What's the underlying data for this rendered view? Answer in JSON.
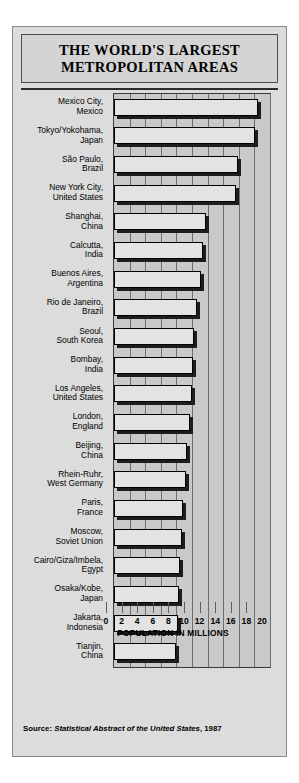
{
  "title": {
    "line1": "THE WORLD'S LARGEST",
    "line2": "METROPOLITAN AREAS"
  },
  "source": {
    "prefix": "Source: ",
    "italic": "Statistical Abstract of the United States",
    "suffix": ", 1987"
  },
  "chart_data": {
    "type": "bar",
    "orientation": "horizontal",
    "title": "THE WORLD'S LARGEST METROPOLITAN AREAS",
    "xlabel": "POPULATION IN MILLIONS",
    "ylabel": "",
    "xlim": [
      0,
      20
    ],
    "xticks": [
      0,
      2,
      4,
      6,
      8,
      10,
      12,
      14,
      16,
      18,
      20
    ],
    "grid": true,
    "legend": false,
    "categories": [
      "Mexico City, Mexico",
      "Tokyo/Yokohama, Japan",
      "São Paulo, Brazil",
      "New York City, United States",
      "Shanghai, China",
      "Calcutta, India",
      "Buenos Aires, Argentina",
      "Rio de Janeiro, Brazil",
      "Seoul, South Korea",
      "Bombay, India",
      "Los Angeles, United States",
      "London, England",
      "Beijing, China",
      "Rhein-Ruhr, West Germany",
      "Paris, France",
      "Moscow, Soviet Union",
      "Cairo/Giza/Imbela, Egypt",
      "Osaka/Kobe, Japan",
      "Jakarta, Indonesia",
      "Tianjin, China"
    ],
    "values": [
      18.4,
      18.1,
      15.9,
      15.6,
      11.8,
      11.4,
      11.1,
      10.7,
      10.3,
      10.1,
      10.0,
      9.8,
      9.4,
      9.2,
      8.9,
      8.7,
      8.5,
      8.3,
      8.2,
      8.0
    ],
    "units": "millions"
  },
  "rows": [
    {
      "label_line1": "Mexico City,",
      "label_line2": "Mexico",
      "value": 18.4
    },
    {
      "label_line1": "Tokyo/Yokohama,",
      "label_line2": "Japan",
      "value": 18.1
    },
    {
      "label_line1": "São Paulo,",
      "label_line2": "Brazil",
      "value": 15.9
    },
    {
      "label_line1": "New York City,",
      "label_line2": "United States",
      "value": 15.6
    },
    {
      "label_line1": "Shanghai,",
      "label_line2": "China",
      "value": 11.8
    },
    {
      "label_line1": "Calcutta,",
      "label_line2": "India",
      "value": 11.4
    },
    {
      "label_line1": "Buenos Aires,",
      "label_line2": "Argentina",
      "value": 11.1
    },
    {
      "label_line1": "Rio de Janeiro,",
      "label_line2": "Brazil",
      "value": 10.7
    },
    {
      "label_line1": "Seoul,",
      "label_line2": "South Korea",
      "value": 10.3
    },
    {
      "label_line1": "Bombay,",
      "label_line2": "India",
      "value": 10.1
    },
    {
      "label_line1": "Los Angeles,",
      "label_line2": "United States",
      "value": 10.0
    },
    {
      "label_line1": "London,",
      "label_line2": "England",
      "value": 9.8
    },
    {
      "label_line1": "Beijing,",
      "label_line2": "China",
      "value": 9.4
    },
    {
      "label_line1": "Rhein-Ruhr,",
      "label_line2": "West Germany",
      "value": 9.2
    },
    {
      "label_line1": "Paris,",
      "label_line2": "France",
      "value": 8.9
    },
    {
      "label_line1": "Moscow,",
      "label_line2": "Soviet Union",
      "value": 8.7
    },
    {
      "label_line1": "Cairo/Giza/Imbela,",
      "label_line2": "Egypt",
      "value": 8.5
    },
    {
      "label_line1": "Osaka/Kobe,",
      "label_line2": "Japan",
      "value": 8.3
    },
    {
      "label_line1": "Jakarta,",
      "label_line2": "Indonesia",
      "value": 8.2
    },
    {
      "label_line1": "Tianjin,",
      "label_line2": "China",
      "value": 8.0
    }
  ],
  "colors": {
    "card_background": "#dcdcdc",
    "plot_background": "#c9c9c9",
    "bar_fill": "#e3e3e3",
    "bar_outline": "#000000",
    "bar_shadow": "#1d1d1d",
    "gridline": "#6e6e6e",
    "text": "#000000"
  }
}
